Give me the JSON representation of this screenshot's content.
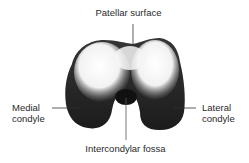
{
  "figure": {
    "labels": {
      "top": "Patellar surface",
      "left_line1": "Medial",
      "left_line2": "condyle",
      "right_line1": "Lateral",
      "right_line2": "condyle",
      "bottom": "Intercondylar fossa"
    }
  }
}
